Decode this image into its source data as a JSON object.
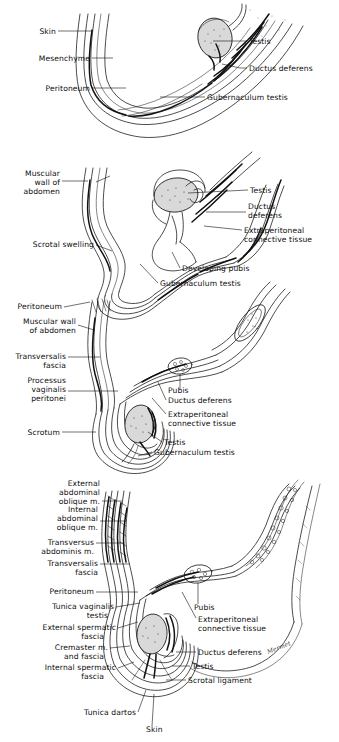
{
  "figure": {
    "signature": "Mermet",
    "panels": [
      {
        "id": "panel-1",
        "stage": "Stage 1 — early intra-abdominal testis",
        "labels_left": [
          {
            "name": "skin",
            "text": "Skin"
          },
          {
            "name": "mesenchyme",
            "text": "Mesenchyme"
          },
          {
            "name": "peritoneum",
            "text": "Peritoneum"
          }
        ],
        "labels_right": [
          {
            "name": "testis",
            "text": "Testis"
          },
          {
            "name": "ductus-deferens",
            "text": "Ductus deferens"
          },
          {
            "name": "gubernaculum-testis",
            "text": "Gubernaculum  testis"
          }
        ]
      },
      {
        "id": "panel-2",
        "stage": "Stage 2 — scrotal swelling forms",
        "labels_left": [
          {
            "name": "muscular-wall-of-abdomen",
            "text": [
              "Muscular",
              "wall of",
              "abdomen"
            ]
          },
          {
            "name": "scrotal-swelling",
            "text": "Scrotal swelling"
          }
        ],
        "labels_right": [
          {
            "name": "testis",
            "text": "Testis"
          },
          {
            "name": "ductus-deferens",
            "text": [
              "Ductus",
              "deferens"
            ]
          },
          {
            "name": "extraperitoneal-connective-tissue",
            "text": [
              "Extraperitoneal",
              "connective tissue"
            ]
          }
        ],
        "labels_bottom": [
          {
            "name": "developing-pubis",
            "text": "Developing pubis"
          },
          {
            "name": "gubernaculum-testis",
            "text": "Gubernaculum testis"
          }
        ]
      },
      {
        "id": "panel-3",
        "stage": "Stage 3 — testis at inguinal canal / processus vaginalis",
        "labels_left": [
          {
            "name": "peritoneum",
            "text": "Peritoneum"
          },
          {
            "name": "muscular-wall-of-abdomen",
            "text": [
              "Muscular wall",
              "of abdomen"
            ]
          },
          {
            "name": "transversalis-fascia",
            "text": [
              "Transversalis",
              "fascia"
            ]
          },
          {
            "name": "processus-vaginalis-peritonei",
            "text": [
              "Processus",
              "vaginalis",
              "peritonei"
            ]
          },
          {
            "name": "scrotum",
            "text": "Scrotum"
          }
        ],
        "labels_right": [
          {
            "name": "pubis",
            "text": "Pubis"
          },
          {
            "name": "ductus-deferens",
            "text": "Ductus deferens"
          },
          {
            "name": "extraperitoneal-connective-tissue",
            "text": [
              "Extraperitoneal",
              "connective tissue"
            ]
          },
          {
            "name": "testis",
            "text": "Testis"
          },
          {
            "name": "gubernaculum-testis",
            "text": "Gubernaculum testis"
          }
        ]
      },
      {
        "id": "panel-4",
        "stage": "Stage 4 — testis descended into scrotum with coverings",
        "labels_left": [
          {
            "name": "external-abdominal-oblique-m",
            "text": [
              "External",
              "abdominal",
              "oblique  m."
            ]
          },
          {
            "name": "internal-abdominal-oblique-m",
            "text": [
              "Internal",
              "abdominal",
              "oblique  m."
            ]
          },
          {
            "name": "transversus-abdominis-m",
            "text": [
              "Transversus",
              "abdominis  m."
            ]
          },
          {
            "name": "transversalis-fascia",
            "text": [
              "Transversalis",
              "fascia"
            ]
          },
          {
            "name": "peritoneum",
            "text": "Peritoneum"
          },
          {
            "name": "tunica-vaginalis-testis",
            "text": [
              "Tunica  vaginalis",
              "testis"
            ]
          },
          {
            "name": "external-spermatic-fascia",
            "text": [
              "External spermatic",
              "fascia"
            ]
          },
          {
            "name": "cremaster-m-and-fascia",
            "text": [
              "Cremaster m.",
              "and fascia"
            ]
          },
          {
            "name": "internal-spermatic-fascia",
            "text": [
              "Internal  spermatic",
              "fascia"
            ]
          }
        ],
        "labels_right": [
          {
            "name": "pubis",
            "text": "Pubis"
          },
          {
            "name": "extraperitoneal-connective-tissue",
            "text": [
              "Extraperitoneal",
              "connective tissue"
            ]
          },
          {
            "name": "ductus-deferens",
            "text": "Ductus deferens"
          },
          {
            "name": "testis",
            "text": "Testis"
          },
          {
            "name": "scrotal-ligament",
            "text": "Scrotal ligament"
          }
        ],
        "labels_bottom": [
          {
            "name": "tunica-dartos",
            "text": "Tunica dartos"
          },
          {
            "name": "skin",
            "text": "Skin"
          }
        ]
      }
    ],
    "colors": {
      "ink": "#111111",
      "paper": "#ffffff",
      "gonad_fill": "#d9d9d9"
    }
  }
}
